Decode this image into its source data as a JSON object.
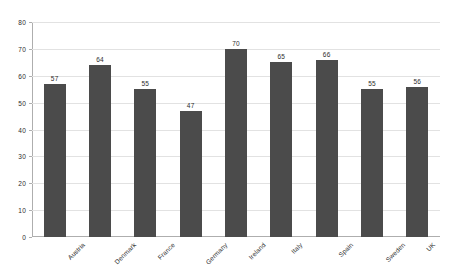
{
  "chart_data": {
    "type": "bar",
    "title": "",
    "subtitle": "",
    "xlabel": "",
    "ylabel": "",
    "categories": [
      "Austria",
      "Denmark",
      "France",
      "Germany",
      "Ireland",
      "Italy",
      "Spain",
      "Sweden",
      "UK"
    ],
    "values": [
      57,
      64,
      55,
      47,
      70,
      65,
      66,
      55,
      56
    ],
    "ylim": [
      0,
      80
    ],
    "yticks": [
      0,
      10,
      20,
      30,
      40,
      50,
      60,
      70,
      80
    ],
    "ytick_labels": [
      "0",
      "10",
      "20",
      "30",
      "40",
      "50",
      "60",
      "70",
      "80"
    ],
    "value_labels": [
      "57",
      "64",
      "55",
      "47",
      "70",
      "65",
      "66",
      "55",
      "56"
    ],
    "grid": true,
    "grid_axis": "y",
    "legend": false,
    "legend_position": "none",
    "bar_color": "#4b4b4b",
    "grid_color": "#e2e2e2",
    "axis_color": "#aeaeae",
    "background_color": "#ffffff",
    "text_color": "#2c2c2c",
    "xtick_label_rotation": -45
  }
}
